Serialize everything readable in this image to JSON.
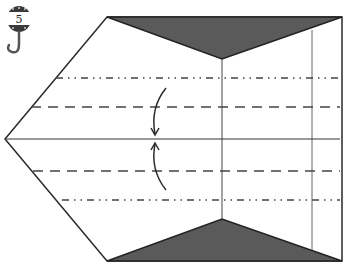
{
  "diagram": {
    "type": "origami-fold-step",
    "step_number": "5",
    "step_badge_icon": "hanging-tag-hook-icon",
    "colors": {
      "line": "#2a2a2a",
      "shaded_flap": "#5a5a5a",
      "paper": "#ffffff"
    },
    "elements": {
      "outline": "pentagon paper shape with left point",
      "top_flap": "shaded triangle at top edge",
      "bottom_flap": "shaded triangle at bottom edge",
      "valley_folds": 2,
      "mountain_folds": 2,
      "center_crease": 1,
      "vertical_creases": 2,
      "fold_arrows": 2
    }
  }
}
